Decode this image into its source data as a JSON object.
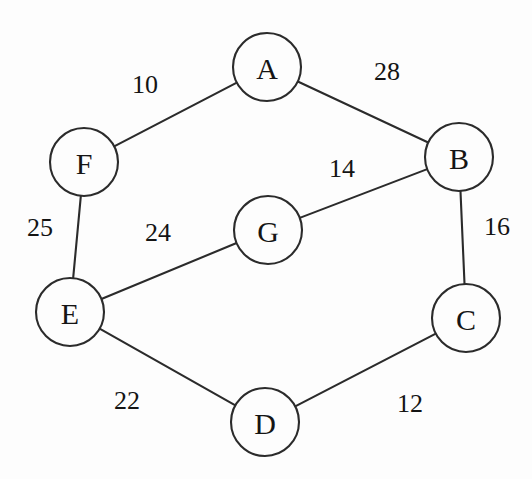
{
  "diagram": {
    "background_color": "#fdfdfd",
    "stroke_color": "#2b2b2b",
    "text_color": "#141414",
    "width": 532,
    "height": 479
  },
  "chart_data": {
    "type": "diagram",
    "graph_type": "undirected-weighted-graph",
    "title": "",
    "node_radius": 34,
    "nodes": [
      {
        "id": "A",
        "label": "A",
        "x": 267,
        "y": 67
      },
      {
        "id": "B",
        "label": "B",
        "x": 459,
        "y": 157
      },
      {
        "id": "C",
        "label": "C",
        "x": 466,
        "y": 318
      },
      {
        "id": "D",
        "label": "D",
        "x": 265,
        "y": 422
      },
      {
        "id": "E",
        "label": "E",
        "x": 70,
        "y": 312
      },
      {
        "id": "F",
        "label": "F",
        "x": 84,
        "y": 162
      },
      {
        "id": "G",
        "label": "G",
        "x": 268,
        "y": 230
      }
    ],
    "edges": [
      {
        "from": "F",
        "to": "A",
        "weight": 10,
        "label": "10",
        "label_x": 145,
        "label_y": 84
      },
      {
        "from": "A",
        "to": "B",
        "weight": 28,
        "label": "28",
        "label_x": 387,
        "label_y": 71
      },
      {
        "from": "G",
        "to": "B",
        "weight": 14,
        "label": "14",
        "label_x": 342,
        "label_y": 168
      },
      {
        "from": "B",
        "to": "C",
        "weight": 16,
        "label": "16",
        "label_x": 497,
        "label_y": 226
      },
      {
        "from": "F",
        "to": "E",
        "weight": 25,
        "label": "25",
        "label_x": 40,
        "label_y": 227
      },
      {
        "from": "E",
        "to": "G",
        "weight": 24,
        "label": "24",
        "label_x": 158,
        "label_y": 232
      },
      {
        "from": "E",
        "to": "D",
        "weight": 22,
        "label": "22",
        "label_x": 127,
        "label_y": 400
      },
      {
        "from": "D",
        "to": "C",
        "weight": 12,
        "label": "12",
        "label_x": 410,
        "label_y": 403
      }
    ]
  }
}
